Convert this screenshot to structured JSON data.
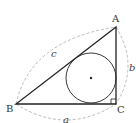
{
  "diagram": {
    "vertices": {
      "A": {
        "label": "A"
      },
      "B": {
        "label": "B"
      },
      "C": {
        "label": "C"
      }
    },
    "sides": {
      "a": {
        "label": "a"
      },
      "b": {
        "label": "b"
      },
      "c": {
        "label": "c"
      }
    },
    "colors": {
      "stroke": "#222222",
      "dashed": "#999999",
      "label": "#333333"
    }
  }
}
